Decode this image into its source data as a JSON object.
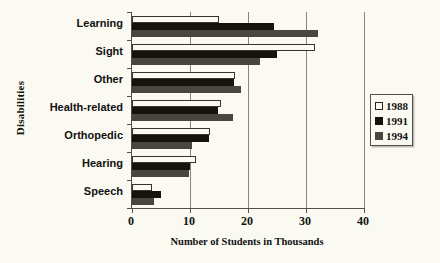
{
  "chart_data": {
    "type": "bar",
    "orientation": "horizontal",
    "title": "",
    "xlabel": "Number of Students in Thousands",
    "ylabel": "Disabilities",
    "categories": [
      "Learning",
      "Sight",
      "Other",
      "Health-related",
      "Orthopedic",
      "Hearing",
      "Speech"
    ],
    "xlim": [
      0,
      40
    ],
    "xticks": [
      0,
      10,
      20,
      30,
      40
    ],
    "xtick_labels": [
      "0",
      "10",
      "20",
      "30",
      "40"
    ],
    "grid": true,
    "legend_position": "right",
    "series": [
      {
        "name": "1988",
        "color": "#fbfaf2",
        "values": [
          15.0,
          31.5,
          17.8,
          15.4,
          13.5,
          11.0,
          3.5
        ]
      },
      {
        "name": "1991",
        "color": "#16130d",
        "values": [
          24.5,
          25.0,
          17.6,
          14.9,
          13.3,
          10.0,
          5.0
        ]
      },
      {
        "name": "1994",
        "color": "#4a463f",
        "values": [
          32.0,
          22.0,
          18.8,
          17.4,
          10.3,
          9.8,
          3.8
        ]
      }
    ]
  }
}
